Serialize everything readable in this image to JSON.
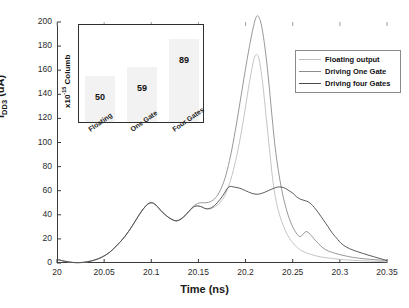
{
  "figure": {
    "xtitle": "Time (ns)",
    "ytitle_main": "I",
    "ytitle_sub": "DD3",
    "ytitle_unit": " (uA)"
  },
  "legend": {
    "items": [
      {
        "label": "Floating output",
        "color": "#bdbdbd"
      },
      {
        "label": "Driving One Gate",
        "color": "#8c8c8c"
      },
      {
        "label": "Driving four Gates",
        "color": "#4a4a4a"
      }
    ]
  },
  "inset": {
    "ylabel_main": "x10",
    "ylabel_exp": "-15",
    "ylabel_rest": " Columb",
    "categories": [
      "Floating",
      "One Gate",
      "Four Gates"
    ],
    "values": [
      50,
      59,
      89
    ],
    "bar_color": "#f2f2f2"
  },
  "chart_data": {
    "type": "line",
    "title": "",
    "xlabel": "Time (ns)",
    "ylabel": "I_DD3 (uA)",
    "xlim": [
      20,
      20.35
    ],
    "ylim": [
      0,
      200
    ],
    "xticks": [
      "20",
      "20.05",
      "20.1",
      "20.15",
      "20.2",
      "20.25",
      "20.3",
      "20.35"
    ],
    "xtick_values": [
      20,
      20.05,
      20.1,
      20.15,
      20.2,
      20.25,
      20.3,
      20.35
    ],
    "yticks": [
      "0",
      "20",
      "40",
      "60",
      "80",
      "100",
      "120",
      "140",
      "160",
      "180",
      "200"
    ],
    "ytick_values": [
      0,
      20,
      40,
      60,
      80,
      100,
      120,
      140,
      160,
      180,
      200
    ],
    "grid": false,
    "legend_position": "upper right",
    "series": [
      {
        "name": "Floating output",
        "color": "#bdbdbd",
        "x": [
          20.0,
          20.008,
          20.016,
          20.024,
          20.032,
          20.04,
          20.048,
          20.056,
          20.064,
          20.072,
          20.08,
          20.088,
          20.095,
          20.1,
          20.105,
          20.112,
          20.12,
          20.127,
          20.134,
          20.14,
          20.146,
          20.152,
          20.158,
          20.163,
          20.168,
          20.173,
          20.178,
          20.183,
          20.188,
          20.193,
          20.198,
          20.202,
          20.206,
          20.21,
          20.214,
          20.218,
          20.222,
          20.226,
          20.23,
          20.236,
          20.244,
          20.252,
          20.26,
          20.27,
          20.28,
          20.29,
          20.3,
          20.32,
          20.35
        ],
        "y": [
          3,
          1.5,
          0.5,
          0.3,
          1,
          2.5,
          5,
          9,
          15,
          22,
          31,
          41,
          48,
          50,
          48,
          42,
          37,
          35,
          38,
          43,
          47,
          47,
          45,
          45,
          47,
          50,
          56,
          66,
          80,
          98,
          120,
          140,
          158,
          172,
          170,
          150,
          120,
          90,
          62,
          40,
          24,
          15,
          10,
          7,
          5,
          4,
          3,
          2,
          1
        ]
      },
      {
        "name": "Driving One Gate",
        "color": "#8c8c8c",
        "x": [
          20.0,
          20.008,
          20.016,
          20.024,
          20.032,
          20.04,
          20.048,
          20.056,
          20.064,
          20.072,
          20.08,
          20.088,
          20.095,
          20.1,
          20.105,
          20.112,
          20.12,
          20.127,
          20.134,
          20.14,
          20.146,
          20.152,
          20.158,
          20.163,
          20.168,
          20.173,
          20.178,
          20.183,
          20.188,
          20.193,
          20.198,
          20.203,
          20.208,
          20.212,
          20.216,
          20.22,
          20.224,
          20.228,
          20.232,
          20.238,
          20.245,
          20.252,
          20.258,
          20.265,
          20.275,
          20.285,
          20.3,
          20.32,
          20.35
        ],
        "y": [
          3,
          1.5,
          0.5,
          0.3,
          1,
          2.5,
          5,
          9,
          15,
          22,
          31,
          41,
          48,
          50,
          48,
          42,
          37,
          35,
          38,
          43,
          48,
          50,
          50,
          51,
          54,
          60,
          70,
          85,
          105,
          128,
          152,
          175,
          195,
          205,
          200,
          182,
          155,
          122,
          92,
          62,
          40,
          27,
          22,
          26,
          18,
          11,
          7,
          4,
          2
        ]
      },
      {
        "name": "Driving four Gates",
        "color": "#4a4a4a",
        "x": [
          20.0,
          20.008,
          20.016,
          20.024,
          20.032,
          20.04,
          20.048,
          20.056,
          20.064,
          20.072,
          20.08,
          20.088,
          20.095,
          20.1,
          20.105,
          20.112,
          20.12,
          20.127,
          20.134,
          20.14,
          20.146,
          20.152,
          20.158,
          20.164,
          20.17,
          20.176,
          20.182,
          20.188,
          20.194,
          20.2,
          20.206,
          20.212,
          20.218,
          20.224,
          20.23,
          20.234,
          20.238,
          20.242,
          20.246,
          20.25,
          20.254,
          20.258,
          20.262,
          20.268,
          20.275,
          20.285,
          20.295,
          20.31,
          20.35
        ],
        "y": [
          3,
          1.5,
          0.5,
          0.3,
          1,
          2.5,
          5,
          9,
          15,
          22,
          31,
          41,
          48,
          50,
          48,
          42,
          37,
          35,
          38,
          43,
          47,
          47,
          45,
          46,
          50,
          56,
          63,
          63,
          62,
          60,
          58,
          57,
          58,
          60,
          62,
          63,
          63,
          62,
          60,
          58,
          55,
          53,
          52,
          50,
          44,
          33,
          22,
          12,
          2
        ]
      }
    ],
    "inset_chart": {
      "type": "bar",
      "categories": [
        "Floating",
        "One Gate",
        "Four Gates"
      ],
      "values": [
        50,
        59,
        89
      ],
      "ylabel": "x10-15 Columb",
      "ylim": [
        0,
        100
      ]
    }
  }
}
